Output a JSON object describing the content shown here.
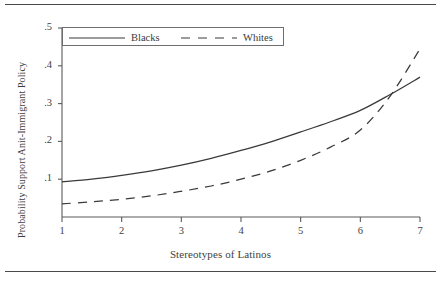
{
  "figure": {
    "top_rule": "horizontal-rule",
    "bottom_rule": "horizontal-rule"
  },
  "chart_data": {
    "type": "line",
    "title": "",
    "subtitle": "",
    "xlabel": "Stereotypes of Latinos",
    "ylabel": "Probability Support Anit-Immigrant Policy",
    "xlim": [
      1,
      7
    ],
    "ylim": [
      0,
      0.5
    ],
    "xticks": [
      1,
      2,
      3,
      4,
      5,
      6,
      7
    ],
    "xticklabels": [
      "1",
      "2",
      "3",
      "4",
      "5",
      "6",
      "7"
    ],
    "yticks": [
      0.1,
      0.2,
      0.3,
      0.4,
      0.5
    ],
    "yticklabels": [
      ".1",
      ".2",
      ".3",
      ".4",
      ".5"
    ],
    "grid": false,
    "legend_position": "top-left-inside",
    "x": [
      1,
      1.5,
      2,
      2.5,
      3,
      3.5,
      4,
      4.5,
      5,
      5.5,
      6,
      6.5,
      7
    ],
    "series": [
      {
        "name": "Blacks",
        "style": "solid",
        "color": "#3a3a3a",
        "values": [
          0.093,
          0.1,
          0.11,
          0.122,
          0.137,
          0.155,
          0.176,
          0.199,
          0.225,
          0.252,
          0.282,
          0.324,
          0.37
        ]
      },
      {
        "name": "Whites",
        "style": "dashed",
        "color": "#3a3a3a",
        "values": [
          0.035,
          0.04,
          0.047,
          0.056,
          0.068,
          0.082,
          0.1,
          0.122,
          0.15,
          0.185,
          0.23,
          0.32,
          0.445
        ]
      }
    ],
    "annotations": [],
    "crossing_point": {
      "x": 5.75,
      "y": 0.29
    }
  },
  "legend": {
    "entries": [
      {
        "label": "Blacks",
        "style": "solid"
      },
      {
        "label": "Whites",
        "style": "dashed"
      }
    ]
  }
}
